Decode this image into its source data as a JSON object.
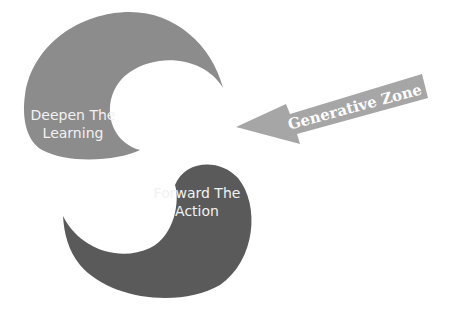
{
  "diagram": {
    "shapes": [
      {
        "id": "top-left",
        "lines": [
          "Deepen The",
          "Learning"
        ],
        "color": "#8c8c8c"
      },
      {
        "id": "bottom-right",
        "lines": [
          "Forward The",
          "Action"
        ],
        "color": "#5a5a5a"
      }
    ],
    "arrow": {
      "label": "Generative Zone",
      "color": "#a6a6a6"
    }
  }
}
